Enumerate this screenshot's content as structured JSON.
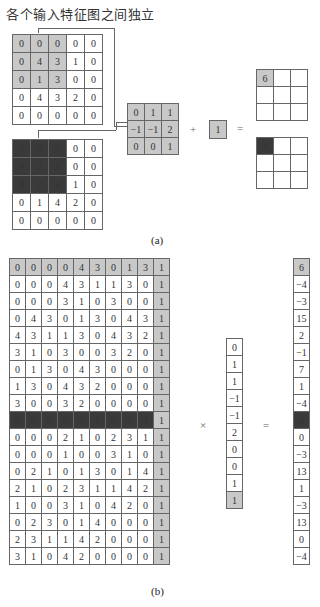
{
  "title": "各个输入特征图之间独立",
  "part_a": {
    "input1": [
      [
        0,
        0,
        0,
        0,
        0
      ],
      [
        0,
        4,
        3,
        1,
        0
      ],
      [
        0,
        1,
        3,
        0,
        0
      ],
      [
        0,
        4,
        3,
        2,
        0
      ],
      [
        0,
        0,
        0,
        0,
        0
      ]
    ],
    "input1_highlight": "gray",
    "input2": [
      [
        0,
        0,
        0,
        0,
        0
      ],
      [
        0,
        2,
        1,
        0,
        0
      ],
      [
        0,
        2,
        3,
        1,
        0
      ],
      [
        0,
        1,
        4,
        2,
        0
      ],
      [
        0,
        0,
        0,
        0,
        0
      ]
    ],
    "input2_highlight": "dark",
    "kernel": [
      [
        "0",
        "1",
        "1"
      ],
      [
        "−1",
        "−1",
        "2"
      ],
      [
        "0",
        "0",
        "1"
      ]
    ],
    "plus": "+",
    "bias": "1",
    "equals": "=",
    "output1_first": "6",
    "output2_first": "4",
    "caption": "(a)"
  },
  "part_b": {
    "matrix": [
      [
        0,
        0,
        0,
        0,
        4,
        3,
        0,
        1,
        3,
        1
      ],
      [
        0,
        0,
        0,
        4,
        3,
        1,
        1,
        3,
        0,
        1
      ],
      [
        0,
        0,
        0,
        3,
        1,
        0,
        3,
        0,
        0,
        1
      ],
      [
        0,
        4,
        3,
        0,
        1,
        3,
        0,
        4,
        3,
        1
      ],
      [
        4,
        3,
        1,
        1,
        3,
        0,
        4,
        3,
        2,
        1
      ],
      [
        3,
        1,
        0,
        3,
        0,
        0,
        3,
        2,
        0,
        1
      ],
      [
        0,
        1,
        3,
        0,
        4,
        3,
        0,
        0,
        0,
        1
      ],
      [
        1,
        3,
        0,
        4,
        3,
        2,
        0,
        0,
        0,
        1
      ],
      [
        3,
        0,
        0,
        3,
        2,
        0,
        0,
        0,
        0,
        1
      ],
      [
        0,
        0,
        0,
        0,
        2,
        1,
        0,
        2,
        3,
        1
      ],
      [
        0,
        0,
        0,
        2,
        1,
        0,
        2,
        3,
        1,
        1
      ],
      [
        0,
        0,
        0,
        1,
        0,
        0,
        3,
        1,
        0,
        1
      ],
      [
        0,
        2,
        1,
        0,
        1,
        3,
        0,
        1,
        4,
        1
      ],
      [
        2,
        1,
        0,
        2,
        3,
        1,
        1,
        4,
        2,
        1
      ],
      [
        1,
        0,
        0,
        3,
        1,
        0,
        4,
        2,
        0,
        1
      ],
      [
        0,
        2,
        3,
        0,
        1,
        4,
        0,
        0,
        0,
        1
      ],
      [
        2,
        3,
        1,
        1,
        4,
        2,
        0,
        0,
        0,
        1
      ],
      [
        3,
        1,
        0,
        4,
        2,
        0,
        0,
        0,
        0,
        1
      ]
    ],
    "highlight_gray_row": 0,
    "highlight_dark_row": 9,
    "weights": [
      "0",
      "1",
      "1",
      "−1",
      "−1",
      "2",
      "0",
      "0",
      "1",
      "1"
    ],
    "times": "×",
    "equals": "=",
    "result": [
      "6",
      "−4",
      "−3",
      "15",
      "2",
      "−1",
      "7",
      "1",
      "−4",
      "4",
      "0",
      "−3",
      "13",
      "1",
      "−3",
      "13",
      "0",
      "−4"
    ],
    "caption": "(b)"
  }
}
